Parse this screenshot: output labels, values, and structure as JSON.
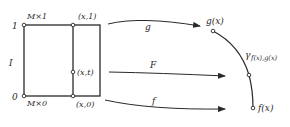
{
  "diagram": {
    "square": {
      "top_left_label": "M×1",
      "bottom_left_label": "M×0",
      "axis_label": "I",
      "tick_top": "1",
      "tick_bottom": "0",
      "point_top": "(x,1)",
      "point_mid": "(x,t)",
      "point_bottom": "(x,0)"
    },
    "arrows": {
      "top": "g",
      "middle": "F",
      "bottom": "f"
    },
    "curve": {
      "top_point": "g(x)",
      "bottom_point": "f(x)",
      "label_main": "γ",
      "label_sub": "f(x),g(x)"
    },
    "colors": {
      "ink": "#2a2a2a",
      "background": "#ffffff"
    }
  }
}
